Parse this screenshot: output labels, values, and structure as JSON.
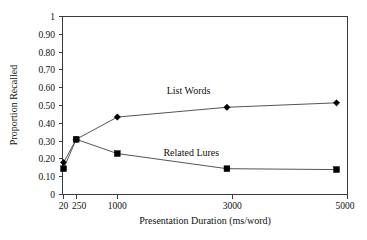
{
  "chart_data": {
    "type": "line",
    "title": "",
    "xlabel": "Presentation Duration (ms/word)",
    "ylabel": "Proportion Recalled",
    "x": [
      20,
      250,
      1000,
      3000,
      5000
    ],
    "xtick_labels": [
      "20",
      "250",
      "1000",
      "3000",
      "5000"
    ],
    "ytick_labels": [
      "0",
      "0.10",
      "0.20",
      "0.30",
      "0.40",
      "0.50",
      "0.60",
      "0.70",
      "0.80",
      "0.90",
      "1"
    ],
    "ytick_values": [
      0,
      0.1,
      0.2,
      0.3,
      0.4,
      0.5,
      0.6,
      0.7,
      0.8,
      0.9,
      1
    ],
    "xlim": [
      0,
      5200
    ],
    "ylim": [
      0,
      1
    ],
    "grid": false,
    "legend_position": "inline-annotation",
    "series": [
      {
        "name": "List Words",
        "marker": "diamond",
        "values": [
          0.18,
          0.31,
          0.435,
          0.49,
          0.515
        ]
      },
      {
        "name": "Related Lures",
        "marker": "square",
        "values": [
          0.145,
          0.31,
          0.23,
          0.145,
          0.14
        ]
      }
    ],
    "annotations": [
      {
        "text": "List Words",
        "x": 2300,
        "y": 0.565
      },
      {
        "text": "Related Lures",
        "x": 2350,
        "y": 0.215
      }
    ],
    "colors": {
      "background": "#ffffff",
      "axis": "#3a3a3a",
      "line": "#555555",
      "marker": "#000000",
      "text": "#111111"
    }
  }
}
